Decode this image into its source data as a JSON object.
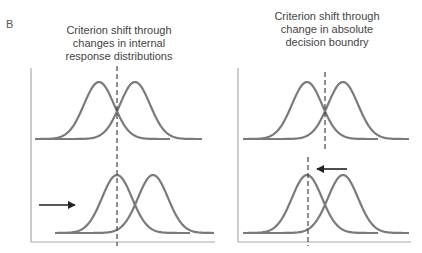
{
  "figure": {
    "panel_label": "B",
    "left_panel": {
      "title": "Criterion shift through changes in internal response distributions"
    },
    "right_panel": {
      "title": "Criterion shift through change in absolute decision boundry"
    },
    "colors": {
      "curve": "#7a7a7a",
      "axis": "#aaaaaa",
      "criterion": "#444444",
      "arrow": "#222222",
      "text": "#444444"
    }
  },
  "chart_data": [
    {
      "type": "line",
      "title": "Criterion shift through changes in internal response distributions",
      "xlabel": "",
      "ylabel": "",
      "grid": false,
      "rows": [
        {
          "position": "top",
          "series": [
            {
              "name": "noise distribution",
              "mean_x": 99,
              "shape": "gaussian"
            },
            {
              "name": "signal distribution",
              "mean_x": 135,
              "shape": "gaussian"
            }
          ],
          "criterion_x": 117
        },
        {
          "position": "bottom",
          "series": [
            {
              "name": "noise distribution",
              "mean_x": 117,
              "shape": "gaussian"
            },
            {
              "name": "signal distribution",
              "mean_x": 153,
              "shape": "gaussian"
            }
          ],
          "criterion_x": 117,
          "annotation": "arrow pointing right (distributions shifted right)"
        }
      ]
    },
    {
      "type": "line",
      "title": "Criterion shift through change in absolute decision boundry",
      "xlabel": "",
      "ylabel": "",
      "grid": false,
      "rows": [
        {
          "position": "top",
          "series": [
            {
              "name": "noise distribution",
              "mean_x": 307,
              "shape": "gaussian"
            },
            {
              "name": "signal distribution",
              "mean_x": 343,
              "shape": "gaussian"
            }
          ],
          "criterion_x": 325
        },
        {
          "position": "bottom",
          "series": [
            {
              "name": "noise distribution",
              "mean_x": 307,
              "shape": "gaussian"
            },
            {
              "name": "signal distribution",
              "mean_x": 343,
              "shape": "gaussian"
            }
          ],
          "criterion_x": 308,
          "annotation": "arrow pointing left (criterion shifted left)"
        }
      ]
    }
  ]
}
